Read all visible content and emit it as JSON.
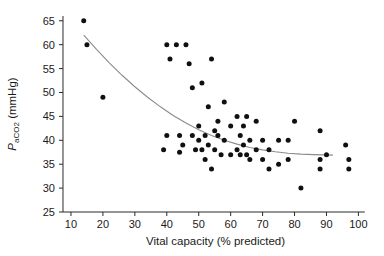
{
  "chart_data": {
    "type": "scatter",
    "title": "",
    "xlabel": "Vital capacity (% predicted)",
    "ylabel": "PaCO2 (mmHg)",
    "ylabel_parts": {
      "main": "P",
      "sub": "aCO",
      "sub2": "2",
      "unit": " (mmHg)"
    },
    "xlim": [
      5,
      103
    ],
    "ylim": [
      25,
      66
    ],
    "xticks": [
      10,
      20,
      30,
      40,
      50,
      60,
      70,
      80,
      90,
      100
    ],
    "yticks": [
      25,
      30,
      35,
      40,
      45,
      50,
      55,
      60,
      65
    ],
    "grid": false,
    "legend": null,
    "point_color": "#101010",
    "curve_color": "#8c8c8c",
    "axis_color": "#2b2b2b",
    "points": [
      [
        14,
        65
      ],
      [
        15,
        60
      ],
      [
        20,
        49
      ],
      [
        39,
        38
      ],
      [
        40,
        41
      ],
      [
        40,
        60
      ],
      [
        41,
        57
      ],
      [
        43,
        60
      ],
      [
        44,
        41
      ],
      [
        44,
        37.5
      ],
      [
        45,
        39
      ],
      [
        46,
        60
      ],
      [
        47,
        56
      ],
      [
        48,
        51
      ],
      [
        48,
        41
      ],
      [
        49,
        38
      ],
      [
        50,
        43
      ],
      [
        50,
        40
      ],
      [
        51,
        52
      ],
      [
        51,
        38
      ],
      [
        52,
        41
      ],
      [
        52,
        36
      ],
      [
        53,
        47
      ],
      [
        53,
        39
      ],
      [
        54,
        57
      ],
      [
        54,
        34
      ],
      [
        55,
        42
      ],
      [
        55,
        38
      ],
      [
        56,
        41
      ],
      [
        56,
        44
      ],
      [
        57,
        37
      ],
      [
        58,
        48
      ],
      [
        58,
        40
      ],
      [
        60,
        43
      ],
      [
        60,
        37
      ],
      [
        62,
        45
      ],
      [
        62,
        38
      ],
      [
        63,
        41
      ],
      [
        63,
        37
      ],
      [
        64,
        43
      ],
      [
        64,
        39
      ],
      [
        65,
        45
      ],
      [
        65,
        37
      ],
      [
        66,
        40
      ],
      [
        66,
        36
      ],
      [
        68,
        44
      ],
      [
        68,
        38
      ],
      [
        70,
        40
      ],
      [
        70,
        36
      ],
      [
        72,
        38
      ],
      [
        72,
        34
      ],
      [
        75,
        40
      ],
      [
        75,
        35
      ],
      [
        78,
        40
      ],
      [
        78,
        36
      ],
      [
        80,
        44
      ],
      [
        82,
        30
      ],
      [
        88,
        42
      ],
      [
        88,
        36
      ],
      [
        88,
        34
      ],
      [
        90,
        37
      ],
      [
        96,
        39
      ],
      [
        97,
        36
      ],
      [
        97,
        34
      ]
    ],
    "fit_curve": {
      "label": "fitted-decay-curve",
      "x_start": 14,
      "x_end": 92,
      "y_start": 62,
      "y_end": 37,
      "points": [
        [
          14,
          62.0
        ],
        [
          18,
          59.0
        ],
        [
          22,
          56.2
        ],
        [
          26,
          53.6
        ],
        [
          30,
          51.2
        ],
        [
          34,
          49.0
        ],
        [
          38,
          47.0
        ],
        [
          42,
          45.2
        ],
        [
          46,
          43.6
        ],
        [
          50,
          42.2
        ],
        [
          54,
          41.0
        ],
        [
          58,
          40.0
        ],
        [
          62,
          39.2
        ],
        [
          66,
          38.5
        ],
        [
          70,
          38.0
        ],
        [
          74,
          37.6
        ],
        [
          78,
          37.3
        ],
        [
          82,
          37.1
        ],
        [
          86,
          37.0
        ],
        [
          92,
          36.9
        ]
      ]
    }
  }
}
